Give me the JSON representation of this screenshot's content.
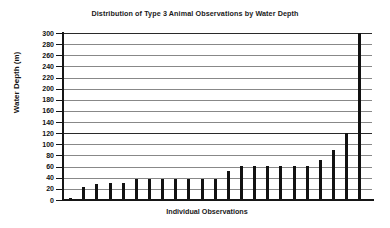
{
  "chart_data": {
    "type": "bar",
    "title": "Distribution of Type 3 Animal Observations by Water Depth",
    "xlabel": "Individual Observations",
    "ylabel": "Water Depth (m)",
    "ylim": [
      0,
      300
    ],
    "ytick_step": 20,
    "yticks": [
      300,
      280,
      260,
      240,
      220,
      200,
      180,
      160,
      140,
      120,
      100,
      80,
      60,
      40,
      20,
      0
    ],
    "ytick_labels": [
      "300",
      "280",
      "260",
      "240",
      "220",
      "200",
      "180",
      "160",
      "140",
      "120",
      "100",
      "80",
      "60",
      "40",
      "20",
      "0"
    ],
    "grid": true,
    "grid_axis": "y",
    "legend": null,
    "categories": [
      "1",
      "2",
      "3",
      "4",
      "5",
      "6",
      "7",
      "8",
      "9",
      "10",
      "11",
      "12",
      "13",
      "14",
      "15",
      "16",
      "17",
      "18",
      "19",
      "20",
      "21",
      "22",
      "23"
    ],
    "values": [
      3,
      24,
      29,
      30,
      30,
      37,
      37,
      37,
      37,
      37,
      37,
      37,
      53,
      61,
      61,
      61,
      61,
      61,
      61,
      72,
      90,
      120,
      300
    ],
    "bar_color": "#111111",
    "series": [
      {
        "name": "Water depth of observation",
        "values": [
          3,
          24,
          29,
          30,
          30,
          37,
          37,
          37,
          37,
          37,
          37,
          37,
          53,
          61,
          61,
          61,
          61,
          61,
          61,
          72,
          90,
          120,
          300
        ]
      }
    ]
  },
  "style": {
    "background": "#ffffff",
    "axis_color": "#161616",
    "grid_color": "#888888"
  }
}
